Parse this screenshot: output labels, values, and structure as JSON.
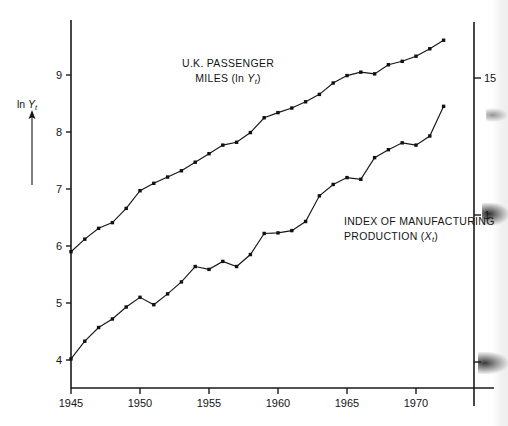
{
  "chart_data": {
    "type": "line",
    "title": "",
    "xlabel": "",
    "ylabel": "ln Y",
    "ylabel_sub": "t",
    "xlim": [
      1944.2,
      1973.2
    ],
    "ylim": [
      3.45,
      10.0
    ],
    "grid": false,
    "legend_position": "inline-annotations",
    "x": [
      1945,
      1946,
      1947,
      1948,
      1949,
      1950,
      1951,
      1952,
      1953,
      1954,
      1955,
      1956,
      1957,
      1958,
      1959,
      1960,
      1961,
      1962,
      1963,
      1964,
      1965,
      1966,
      1967,
      1968,
      1969,
      1970,
      1971,
      1972
    ],
    "x_tick_labels": [
      "1945",
      "1950",
      "1955",
      "1960",
      "1965",
      "1970"
    ],
    "x_ticks": [
      1945,
      1950,
      1955,
      1960,
      1965,
      1970
    ],
    "y_tick_labels": [
      "9",
      "8",
      "7",
      "6",
      "5",
      "4"
    ],
    "y_ticks": [
      9,
      8,
      7,
      6,
      5,
      4
    ],
    "right_axis": {
      "tick_labels": [
        "15",
        "1",
        ""
      ],
      "tick_values": [
        15,
        1,
        0
      ],
      "note": "right-hand axis labels partially cut off / obscured by scan smudge at image edge"
    },
    "series": [
      {
        "name": "U.K. PASSENGER MILES (ln Yt)",
        "marker": "square",
        "values": [
          5.9,
          6.12,
          6.31,
          6.41,
          6.66,
          6.97,
          7.1,
          7.21,
          7.32,
          7.47,
          7.62,
          7.77,
          7.82,
          7.99,
          8.25,
          8.34,
          8.42,
          8.53,
          8.66,
          8.86,
          8.99,
          9.05,
          9.02,
          9.18,
          9.24,
          9.33,
          9.46,
          9.61
        ]
      },
      {
        "name": "INDEX OF MANUFACTURING PRODUCTION (Xt)",
        "marker": "square",
        "values": [
          4.02,
          4.33,
          4.57,
          4.72,
          4.93,
          5.1,
          4.97,
          5.16,
          5.37,
          5.64,
          5.59,
          5.73,
          5.64,
          5.85,
          6.22,
          6.23,
          6.27,
          6.43,
          6.88,
          7.08,
          7.2,
          7.17,
          7.55,
          7.69,
          7.81,
          7.77,
          7.93,
          8.45
        ]
      }
    ],
    "annotations": [
      {
        "id": "upper",
        "line1": "U.K. PASSENGER",
        "line2_prefix": "MILES (ln ",
        "line2_var": "Y",
        "line2_sub": "t",
        "line2_suffix": ")"
      },
      {
        "id": "lower",
        "line1": "INDEX OF MANUFACTURING",
        "line2_prefix": "PRODUCTION (",
        "line2_var": "X",
        "line2_sub": "t",
        "line2_suffix": ")"
      }
    ],
    "axis_arrow": {
      "label_prefix": "ln ",
      "label_var": "Y",
      "label_sub": "t"
    },
    "colors": {
      "ink": "#141414",
      "axis": "#1a1a1a",
      "background": "#ffffff"
    }
  }
}
